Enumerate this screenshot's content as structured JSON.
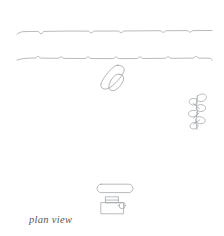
{
  "drawing": {
    "title": "plan view",
    "caption": "plan view",
    "medium": "line drawing",
    "background_color": "#ffffff",
    "stroke_color": "#9a9da1",
    "caption_color": "#55585c",
    "canvas": {
      "width": 224,
      "height": 236
    }
  },
  "elements": {
    "road_upper_edge": {
      "name": "upper roadway edge",
      "label": "",
      "x_start": 17,
      "x_end": 212,
      "y": 32,
      "notch_positions": [
        41,
        92,
        120,
        163,
        190
      ],
      "stroke": "#9a9da1"
    },
    "road_lower_edge": {
      "name": "lower roadway edge",
      "label": "",
      "x_start": 17,
      "x_end": 212,
      "y": 58,
      "notch_positions": [
        38,
        62,
        88,
        116,
        140,
        168,
        196
      ],
      "stroke": "#9a9da1"
    },
    "boats": {
      "name": "paired boat hulls",
      "label": "",
      "center_x": 114,
      "center_y": 79,
      "rotation_deg": 33,
      "count": 2,
      "stroke": "#9a9da1"
    },
    "tree": {
      "name": "tree in plan",
      "label": "",
      "center_x": 198,
      "center_y": 112,
      "height": 36,
      "lobe_count": 6,
      "stroke": "#9a9da1"
    },
    "bench": {
      "name": "bench or table slab",
      "label": "",
      "x": 97,
      "y": 184,
      "width": 36,
      "height": 9,
      "stroke": "#9a9da1"
    },
    "vehicle": {
      "name": "vehicle in plan",
      "label": "",
      "x": 101,
      "y": 197,
      "width": 26,
      "height": 17,
      "stroke": "#9a9da1"
    }
  }
}
